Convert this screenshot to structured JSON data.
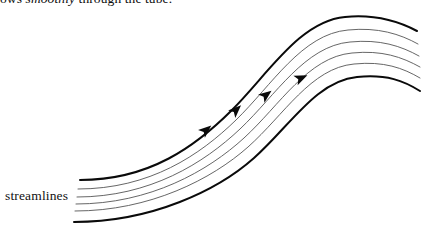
{
  "figure": {
    "caption": {
      "text_before_italic": "ows ",
      "italic_word": "smoothly",
      "text_after_italic": " through the tube."
    },
    "labels": {
      "streamlines": "streamlines"
    },
    "colors": {
      "background": "#ffffff",
      "stroke_boundary": "#0a0a0a",
      "stroke_interior": "#555555",
      "arrow_fill": "#0a0a0a",
      "text": "#111111"
    },
    "geometry": {
      "canvas_width": 422,
      "canvas_height": 227,
      "streamline_count": 6,
      "arrow_count": 4,
      "streamlines": [
        {
          "name": "boundary-top",
          "kind": "boundary",
          "stroke_width": 2.0,
          "path": "M 80 180 C 150 180 196 146 232 110 C 268 74 300 21 345 17 C 375 14 398 21 417 31"
        },
        {
          "name": "interior-1",
          "kind": "interior",
          "stroke_width": 0.9,
          "path": "M 78 189 C 150 189 200 155 236 120 C 272 85 302 34 348 30 C 378 27 400 34 418 44"
        },
        {
          "name": "interior-2",
          "kind": "interior",
          "stroke_width": 0.9,
          "path": "M 77 197 C 150 197 204 163 240 129 C 276 95 305 46 350 42 C 380 39 401 46 419 56"
        },
        {
          "name": "interior-3",
          "kind": "interior",
          "stroke_width": 0.9,
          "path": "M 76 204 C 150 204 208 171 244 138 C 280 105 308 57 352 53 C 382 50 402 57 420 67"
        },
        {
          "name": "interior-4",
          "kind": "interior",
          "stroke_width": 0.9,
          "path": "M 75 211 C 150 211 212 179 248 147 C 284 115 311 68 354 64 C 384 61 403 68 420 78"
        },
        {
          "name": "boundary-bottom",
          "kind": "boundary",
          "stroke_width": 2.0,
          "path": "M 74 222 C 152 222 218 190 254 158 C 290 126 316 81 357 77 C 387 74 404 81 420 91"
        }
      ],
      "arrows": [
        {
          "name": "arrow-1",
          "x": 206,
          "y": 130,
          "angle": -41
        },
        {
          "name": "arrow-2",
          "x": 236,
          "y": 110,
          "angle": -44
        },
        {
          "name": "arrow-3",
          "x": 266,
          "y": 95,
          "angle": -38
        },
        {
          "name": "arrow-4",
          "x": 301,
          "y": 78,
          "angle": -24
        }
      ]
    }
  }
}
